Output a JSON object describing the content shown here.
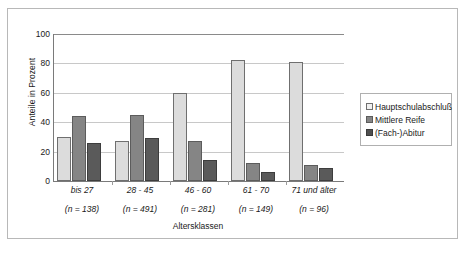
{
  "chart_data": {
    "type": "bar",
    "title": "",
    "xlabel": "Altersklassen",
    "ylabel": "Anteile in Prozent",
    "ylim": [
      0,
      100
    ],
    "ytick_step": 20,
    "yticks": [
      0,
      20,
      40,
      60,
      80,
      100
    ],
    "grid": true,
    "legend_position": "right",
    "categories": [
      "bis 27",
      "28 - 45",
      "46 - 60",
      "61 - 70",
      "71 und älter"
    ],
    "category_counts": [
      "(n = 138)",
      "(n = 491)",
      "(n = 281)",
      "(n = 149)",
      "(n = 96)"
    ],
    "series": [
      {
        "name": "Hauptschulabschluß",
        "color": "#dcdcdc",
        "values": [
          30,
          27,
          60,
          82,
          81
        ]
      },
      {
        "name": "Mittlere Reife",
        "color": "#858585",
        "values": [
          44,
          45,
          27,
          12,
          11
        ]
      },
      {
        "name": "(Fach-)Abitur",
        "color": "#5a5a5a",
        "values": [
          26,
          29,
          14,
          6,
          9
        ]
      }
    ]
  },
  "axes": {
    "y_title": "Anteile in Prozent",
    "x_title": "Altersklassen",
    "y_ticks": [
      "0",
      "20",
      "40",
      "60",
      "80",
      "100"
    ]
  },
  "legend": {
    "items": [
      {
        "label": "Hauptschulabschluß",
        "swatch": "light-gray-swatch"
      },
      {
        "label": "Mittlere Reife",
        "swatch": "medium-gray-swatch"
      },
      {
        "label": "(Fach-)Abitur",
        "swatch": "dark-gray-swatch"
      }
    ]
  }
}
